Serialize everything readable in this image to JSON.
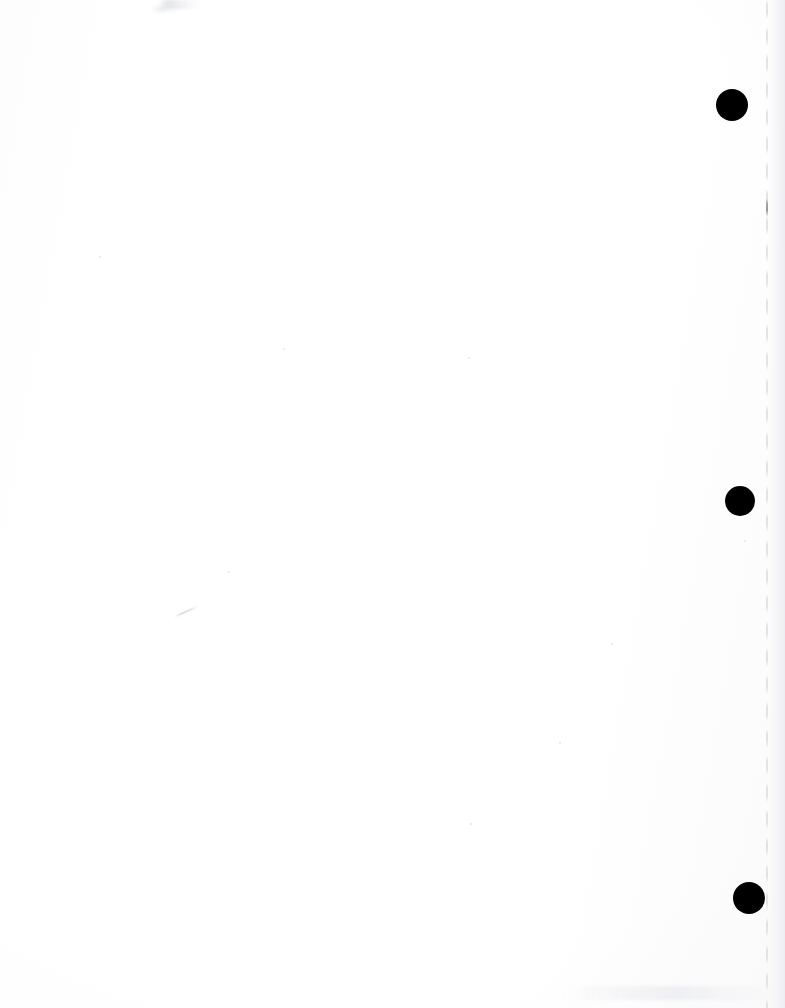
{
  "document": {
    "kind": "scanned-page",
    "title": "Scanned Blank Page",
    "page_width": 785,
    "page_height": 1008,
    "background_color": "#ffffff",
    "text_content": "",
    "note": ""
  },
  "marks": {
    "color": "#000000",
    "shape": "filled-circle",
    "count": 3,
    "items": [
      {
        "name": "registration-mark-top",
        "label": "",
        "x": 716,
        "y": 89,
        "diameter": 32
      },
      {
        "name": "registration-mark-middle",
        "label": "",
        "x": 725,
        "y": 486,
        "diameter": 30
      },
      {
        "name": "registration-mark-bottom",
        "label": "",
        "x": 733,
        "y": 882,
        "diameter": 32
      }
    ]
  },
  "artifacts": {
    "items": [
      {
        "name": "scan-smudge-top-left",
        "x": 158,
        "y": 0,
        "width": 44,
        "height": 9,
        "color": "#e2e3e7"
      },
      {
        "name": "scan-smudge-top-left-2",
        "x": 150,
        "y": 6,
        "width": 30,
        "height": 6,
        "color": "#eceded"
      },
      {
        "name": "scan-tick-right-margin",
        "x": 766,
        "y": 199,
        "width": 2,
        "height": 18,
        "color": "#8c8d92"
      },
      {
        "name": "scan-scratch-mid-left",
        "x": 174,
        "y": 616,
        "width": 26,
        "height": 2,
        "color": "#d6d7db"
      },
      {
        "name": "page-edge-line-right",
        "x": 766,
        "y": 0,
        "width": 2,
        "height": 1008,
        "color": "#dadbe0"
      },
      {
        "name": "page-edge-shading",
        "x": 769,
        "y": 0,
        "width": 16,
        "height": 1008,
        "color": "#edeef1"
      },
      {
        "name": "scan-specks-bottom",
        "x": 560,
        "y": 986,
        "width": 215,
        "height": 14,
        "color": "#e9eaee"
      }
    ],
    "specks": [
      {
        "name": "speck-a",
        "x": 99,
        "y": 256,
        "size": 2
      },
      {
        "name": "speck-b",
        "x": 283,
        "y": 348,
        "size": 2
      },
      {
        "name": "speck-c",
        "x": 468,
        "y": 357,
        "size": 2
      },
      {
        "name": "speck-d",
        "x": 611,
        "y": 643,
        "size": 2
      },
      {
        "name": "speck-e",
        "x": 744,
        "y": 540,
        "size": 2
      },
      {
        "name": "speck-f",
        "x": 559,
        "y": 742,
        "size": 2
      },
      {
        "name": "speck-g",
        "x": 228,
        "y": 571,
        "size": 2
      },
      {
        "name": "speck-h",
        "x": 470,
        "y": 823,
        "size": 2
      }
    ]
  }
}
